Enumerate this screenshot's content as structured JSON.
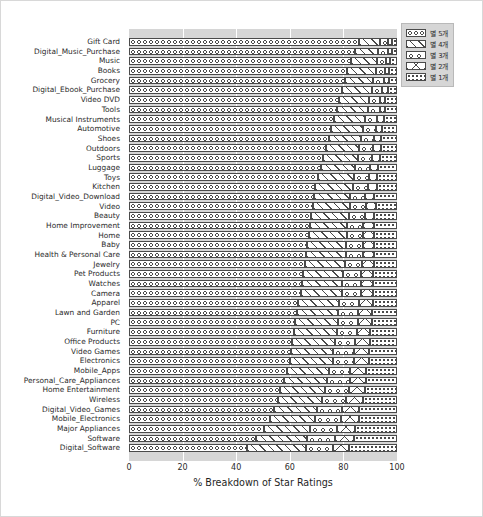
{
  "chart_data": {
    "type": "bar",
    "orientation": "horizontal",
    "stacked": true,
    "normalized_percent": true,
    "title": "",
    "xlabel": "% Breakdown of Star Ratings",
    "ylabel": "",
    "xlim": [
      0,
      100
    ],
    "xticks": [
      0,
      20,
      40,
      60,
      80,
      100
    ],
    "grid": "vertical-white-gridlines",
    "legend_position": "upper-right-outside",
    "legend": [
      "별 5개",
      "별 4개",
      "별 3개",
      "별 2개",
      "별 1개"
    ],
    "hatches": [
      "o",
      "/",
      "o.",
      "x",
      "."
    ],
    "categories": [
      "Gift Card",
      "Digital_Music_Purchase",
      "Music",
      "Books",
      "Grocery",
      "Digital_Ebook_Purchase",
      "Video DVD",
      "Tools",
      "Musical Instruments",
      "Automotive",
      "Shoes",
      "Outdoors",
      "Sports",
      "Luggage",
      "Toys",
      "Kitchen",
      "Digital_Video_Download",
      "Video",
      "Beauty",
      "Home Improvement",
      "Home",
      "Baby",
      "Health & Personal Care",
      "Jewelry",
      "Pet Products",
      "Watches",
      "Camera",
      "Apparel",
      "Lawn and Garden",
      "PC",
      "Furniture",
      "Office Products",
      "Video Games",
      "Electronics",
      "Mobile_Apps",
      "Personal_Care_Appliances",
      "Home Entertainment",
      "Wireless",
      "Digital_Video_Games",
      "Mobile_Electronics",
      "Major Appliances",
      "Software",
      "Digital_Software"
    ],
    "series": [
      {
        "name": "별 5개",
        "hatch": "o",
        "values": [
          86.0,
          84.5,
          83.0,
          81.5,
          80.5,
          79.5,
          78.5,
          77.5,
          76.5,
          75.5,
          74.5,
          73.5,
          72.5,
          71.5,
          70.5,
          69.5,
          69.0,
          68.5,
          68.0,
          67.5,
          67.0,
          66.5,
          66.0,
          65.5,
          65.0,
          64.5,
          64.0,
          63.0,
          62.5,
          62.0,
          61.5,
          61.0,
          60.5,
          60.0,
          59.0,
          58.0,
          56.5,
          55.5,
          54.0,
          52.5,
          50.5,
          47.5,
          44.0
        ]
      },
      {
        "name": "별 4개",
        "hatch": "/",
        "values": [
          7.5,
          8.5,
          9.5,
          10.5,
          10.5,
          11.0,
          11.0,
          11.5,
          11.5,
          12.0,
          12.0,
          12.5,
          13.0,
          13.0,
          13.5,
          14.0,
          13.5,
          14.0,
          14.0,
          14.0,
          14.5,
          14.5,
          15.0,
          15.0,
          15.0,
          15.0,
          15.5,
          15.5,
          15.5,
          16.0,
          16.0,
          16.0,
          15.5,
          16.0,
          15.5,
          16.0,
          16.5,
          16.5,
          16.0,
          17.0,
          17.0,
          19.0,
          22.0
        ]
      },
      {
        "name": "별 3개",
        "hatch": "o.",
        "values": [
          3.0,
          3.5,
          3.5,
          3.5,
          4.0,
          4.0,
          4.0,
          4.5,
          4.5,
          4.5,
          5.0,
          5.0,
          5.0,
          5.5,
          5.5,
          5.5,
          5.5,
          6.0,
          6.0,
          6.0,
          6.0,
          6.5,
          6.5,
          6.5,
          6.5,
          7.0,
          7.0,
          7.5,
          7.5,
          7.5,
          7.5,
          7.5,
          8.0,
          8.0,
          8.0,
          8.5,
          9.0,
          9.0,
          9.5,
          9.5,
          10.0,
          10.5,
          10.0
        ]
      },
      {
        "name": "별 2개",
        "hatch": "x",
        "values": [
          1.5,
          1.5,
          1.5,
          1.5,
          2.0,
          2.0,
          2.0,
          2.0,
          2.5,
          2.5,
          2.5,
          3.0,
          3.0,
          3.0,
          3.0,
          3.5,
          3.5,
          3.5,
          3.5,
          4.0,
          4.0,
          4.0,
          4.0,
          4.5,
          4.5,
          4.5,
          4.5,
          5.0,
          5.0,
          5.0,
          5.0,
          5.5,
          5.5,
          5.5,
          6.0,
          6.0,
          6.0,
          6.5,
          6.5,
          7.0,
          7.0,
          7.0,
          6.0
        ]
      },
      {
        "name": "별 1개",
        "hatch": ".",
        "values": [
          2.0,
          2.0,
          2.5,
          3.0,
          3.0,
          3.5,
          4.5,
          4.5,
          5.0,
          5.5,
          6.0,
          6.0,
          6.5,
          7.0,
          7.5,
          7.5,
          8.5,
          8.0,
          8.5,
          8.5,
          8.5,
          8.5,
          8.5,
          8.5,
          9.0,
          9.0,
          9.0,
          9.0,
          9.5,
          9.5,
          10.0,
          10.0,
          10.5,
          10.5,
          11.5,
          11.5,
          12.0,
          12.5,
          14.0,
          14.0,
          15.5,
          16.0,
          18.0
        ]
      }
    ]
  }
}
